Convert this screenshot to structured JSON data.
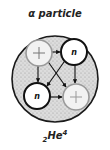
{
  "title": "α particle",
  "formula": {
    "subscript": "2",
    "symbol": "He",
    "superscript": "4"
  },
  "nucleus": {
    "fill": "#d8d8d8",
    "stroke": "#1a1a1a",
    "nucleons": [
      {
        "type": "proton",
        "label": "+",
        "position": "top-left"
      },
      {
        "type": "neutron",
        "label": "n",
        "position": "top-right"
      },
      {
        "type": "neutron",
        "label": "n",
        "position": "bottom-left"
      },
      {
        "type": "proton",
        "label": "+",
        "position": "bottom-right"
      }
    ]
  },
  "colors": {
    "proton_stroke": "#9a9a9a",
    "neutron_stroke": "#111111"
  }
}
